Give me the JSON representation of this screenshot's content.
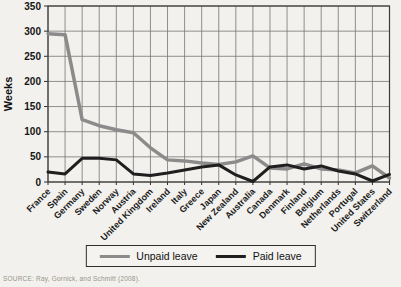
{
  "figure": {
    "source": "SOURCE: Ray, Gornick, and Schmitt (2008).",
    "colors": {
      "background": "#f2f1ed",
      "grid": "#757575",
      "plot_border": "#3a3a3a",
      "unpaid": "#8b8b8b",
      "paid": "#1f1f1f"
    }
  },
  "chart_data": {
    "type": "line",
    "title": "",
    "xlabel": "",
    "ylabel": "Weeks",
    "ylim": [
      0,
      350
    ],
    "yticks": [
      0,
      50,
      100,
      150,
      200,
      250,
      300,
      350
    ],
    "grid": true,
    "legend_position": "bottom",
    "categories": [
      "France",
      "Spain",
      "Germany",
      "Sweden",
      "Norway",
      "Austria",
      "United Kingdom",
      "Ireland",
      "Italy",
      "Greece",
      "Japan",
      "New Zealand",
      "Australia",
      "Canada",
      "Denmark",
      "Finland",
      "Belgium",
      "Netherlands",
      "Portugal",
      "United States",
      "Switzerland"
    ],
    "series": [
      {
        "name": "Unpaid leave",
        "color": "#8b8b8b",
        "width": 3.5,
        "values": [
          295,
          293,
          124,
          112,
          104,
          98,
          68,
          44,
          42,
          38,
          35,
          40,
          52,
          28,
          26,
          36,
          26,
          24,
          18,
          32,
          8
        ]
      },
      {
        "name": "Paid leave",
        "color": "#1f1f1f",
        "width": 3,
        "values": [
          20,
          16,
          47,
          47,
          44,
          16,
          13,
          18,
          24,
          30,
          34,
          14,
          1,
          30,
          34,
          26,
          32,
          22,
          16,
          2,
          15
        ]
      }
    ]
  }
}
